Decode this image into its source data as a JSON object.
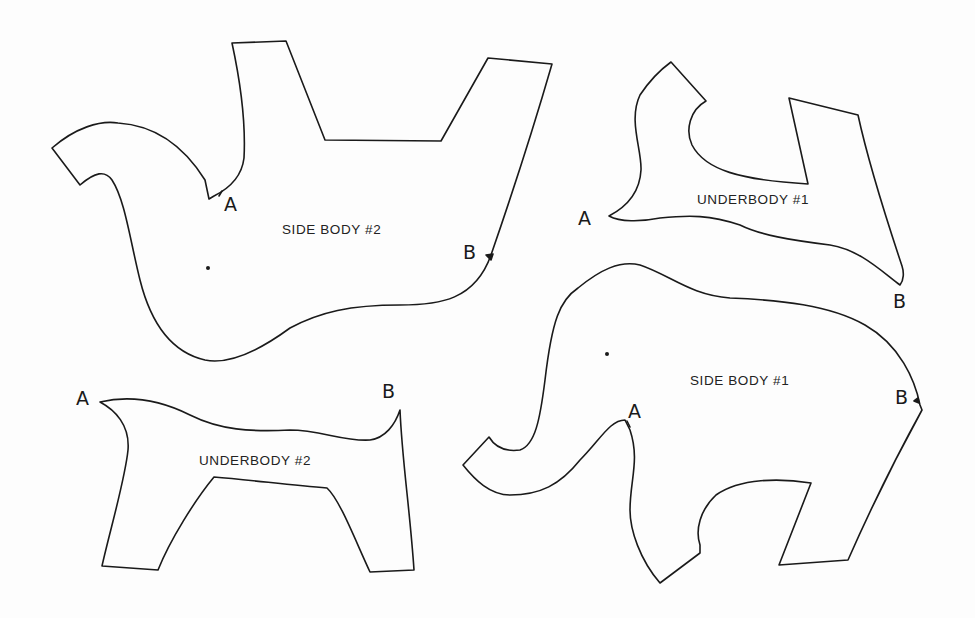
{
  "diagram": {
    "type": "sewing-pattern",
    "background": "#fdfdfd",
    "line_color": "#1a1a1a",
    "pieces": [
      {
        "id": "side-body-2",
        "label": "SIDE BODY #2",
        "marks": [
          {
            "name": "A",
            "text": "A"
          },
          {
            "name": "B",
            "text": "B"
          }
        ],
        "has_eye_dot": true
      },
      {
        "id": "underbody-1",
        "label": "UNDERBODY #1",
        "marks": [
          {
            "name": "A",
            "text": "A"
          },
          {
            "name": "B",
            "text": "B"
          }
        ],
        "has_eye_dot": false
      },
      {
        "id": "underbody-2",
        "label": "UNDERBODY #2",
        "marks": [
          {
            "name": "A",
            "text": "A"
          },
          {
            "name": "B",
            "text": "B"
          }
        ],
        "has_eye_dot": false
      },
      {
        "id": "side-body-1",
        "label": "SIDE BODY #1",
        "marks": [
          {
            "name": "A",
            "text": "A"
          },
          {
            "name": "B",
            "text": "B"
          }
        ],
        "has_eye_dot": true
      }
    ]
  }
}
